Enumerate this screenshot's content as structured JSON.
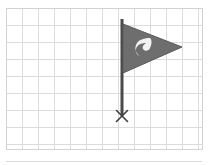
{
  "canvas": {
    "width": 210,
    "height": 165,
    "background_color": "#ffffff",
    "title": "Flag marker on graph paper"
  },
  "grid": {
    "name": "graph-paper-grid",
    "line_color": "#dcdcdc",
    "line_width": 1,
    "cell_width": 16,
    "cell_height": 17,
    "origin_x": 6,
    "origin_y": 8,
    "columns": 13,
    "rows": 9,
    "frame_color": "#d2d2d2",
    "frame_left": 6,
    "frame_top": 8,
    "frame_right": 202,
    "frame_bottom": 149
  },
  "figure": {
    "name": "pennant-flag-marker",
    "pole": {
      "label": "flag-pole",
      "color": "#4a4a4a",
      "width": 3,
      "x": 122,
      "top_y": 19,
      "bottom_y": 115
    },
    "flag": {
      "label": "pennant-flag",
      "shape": "triangle",
      "fill_color": "#6e6e6e",
      "stroke_color": "#5a5a5a",
      "points": "123,24 182,47 123,73",
      "tip_x": 182,
      "tip_y": 47
    },
    "emblem": {
      "label": "flag-emblem",
      "fill_color": "#f2f2f2",
      "description": "white stylized hook mark inside flag",
      "path": "M150,38 C143,38 138,40 136,45 C134,50 137,54 140,56 C137,55 135,52 136,49 C137,45 141,43 146,43 C143,45 142,47 143,49 C145,52 149,51 150,48 C152,44 152,40 150,38 Z"
    },
    "base_marker": {
      "label": "base-x-marker",
      "glyph": "×",
      "color": "#3d3d3d",
      "x": 122,
      "y": 116,
      "size": 11
    }
  }
}
